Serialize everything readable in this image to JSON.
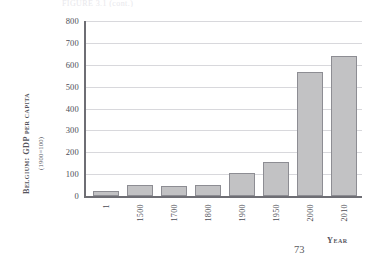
{
  "page": {
    "folio": "73",
    "caption_sliver": "FIGURE 3.1  (cont.)"
  },
  "chart_data": {
    "type": "bar",
    "title": "",
    "xlabel": "Year",
    "ylabel": "Belgium: GDP per capita",
    "ylabel_sub": "(1900=100)",
    "categories": [
      "1",
      "1500",
      "1700",
      "1800",
      "1900",
      "1950",
      "2000",
      "2010"
    ],
    "values": [
      25,
      50,
      47,
      52,
      107,
      155,
      565,
      640
    ],
    "ylim": [
      0,
      800
    ],
    "yticks": [
      0,
      100,
      200,
      300,
      400,
      500,
      600,
      700,
      800
    ],
    "ytick_labels": [
      "0",
      "100",
      "200",
      "300",
      "400",
      "500",
      "600",
      "700",
      "800"
    ],
    "grid": true,
    "legend": "none",
    "bar_fill": "#c2c2c4",
    "bar_stroke": "#8d8d93",
    "axis_color": "#6e6e74",
    "grid_color": "#d8d8dc"
  }
}
